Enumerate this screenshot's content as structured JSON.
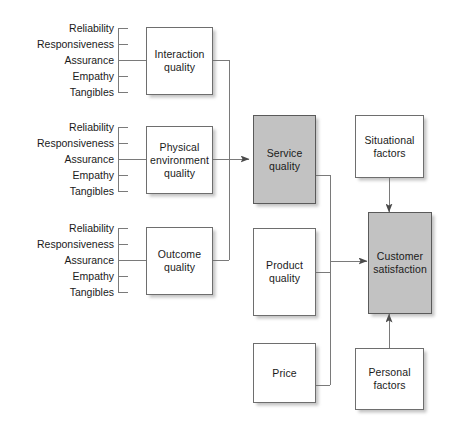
{
  "figure": {
    "type": "concept-model-diagram",
    "colors": {
      "shaded_fill": "#c2c2c2",
      "plain_fill": "#ffffff",
      "stroke": "#6e6e6e",
      "text": "#1a1a1a",
      "background": "#ffffff"
    }
  },
  "dimension_groups": [
    {
      "id": "interaction",
      "target": "Interaction quality",
      "items": [
        "Reliability",
        "Responsiveness",
        "Assurance",
        "Empathy",
        "Tangibles"
      ]
    },
    {
      "id": "physical",
      "target": "Physical environment quality",
      "items": [
        "Reliability",
        "Responsiveness",
        "Assurance",
        "Empathy",
        "Tangibles"
      ]
    },
    {
      "id": "outcome",
      "target": "Outcome quality",
      "items": [
        "Reliability",
        "Responsiveness",
        "Assurance",
        "Empathy",
        "Tangibles"
      ]
    }
  ],
  "nodes": {
    "interaction_quality": {
      "label": "Interaction\nquality",
      "shaded": false
    },
    "physical_environment_quality": {
      "label": "Physical\nenvironment\nquality",
      "shaded": false
    },
    "outcome_quality": {
      "label": "Outcome\nquality",
      "shaded": false
    },
    "service_quality": {
      "label": "Service\nquality",
      "shaded": true
    },
    "product_quality": {
      "label": "Product\nquality",
      "shaded": false
    },
    "price": {
      "label": "Price",
      "shaded": false
    },
    "situational_factors": {
      "label": "Situational\nfactors",
      "shaded": false
    },
    "customer_satisfaction": {
      "label": "Customer\nsatisfaction",
      "shaded": true
    },
    "personal_factors": {
      "label": "Personal\nfactors",
      "shaded": false
    }
  },
  "edges": [
    {
      "from": "interaction_quality",
      "to": "service_quality",
      "arrow": true
    },
    {
      "from": "physical_environment_quality",
      "to": "service_quality",
      "arrow": true
    },
    {
      "from": "outcome_quality",
      "to": "service_quality",
      "arrow": true
    },
    {
      "from": "service_quality",
      "to": "customer_satisfaction",
      "arrow": true
    },
    {
      "from": "product_quality",
      "to": "customer_satisfaction",
      "arrow": true
    },
    {
      "from": "price",
      "to": "customer_satisfaction",
      "arrow": true
    },
    {
      "from": "situational_factors",
      "to": "customer_satisfaction",
      "arrow": true
    },
    {
      "from": "personal_factors",
      "to": "customer_satisfaction",
      "arrow": true
    }
  ]
}
